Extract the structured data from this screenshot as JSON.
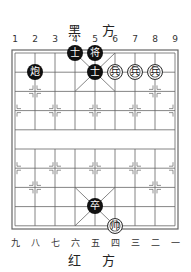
{
  "board": {
    "top_side_label": "黑 方",
    "bottom_side_label": "红 方",
    "top_file_labels": [
      "1",
      "2",
      "3",
      "4",
      "5",
      "6",
      "7",
      "8",
      "9"
    ],
    "bottom_file_labels": [
      "九",
      "八",
      "七",
      "六",
      "五",
      "四",
      "三",
      "二",
      "一"
    ],
    "pieces": [
      {
        "side": "black",
        "char": "士",
        "file": 4,
        "rank": 0
      },
      {
        "side": "black",
        "char": "将",
        "file": 5,
        "rank": 0
      },
      {
        "side": "black",
        "char": "炮",
        "file": 2,
        "rank": 1
      },
      {
        "side": "black",
        "char": "士",
        "file": 5,
        "rank": 1
      },
      {
        "side": "red",
        "char": "兵",
        "file": 6,
        "rank": 1
      },
      {
        "side": "red",
        "char": "兵",
        "file": 7,
        "rank": 1
      },
      {
        "side": "red",
        "char": "兵",
        "file": 8,
        "rank": 1
      },
      {
        "side": "black",
        "char": "卒",
        "file": 5,
        "rank": 8
      },
      {
        "side": "red",
        "char": "帅",
        "file": 6,
        "rank": 9
      }
    ]
  }
}
